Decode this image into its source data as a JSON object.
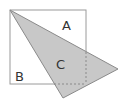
{
  "diagram": {
    "square": {
      "x": 10,
      "y": 10,
      "size": 74,
      "stroke": "#9a9a9a"
    },
    "triangle": {
      "points": "10,10 118,69 63,98",
      "fill": "#c8c8c8",
      "stroke": "#8a8a8a"
    },
    "labels": {
      "a": "A",
      "b": "B",
      "c": "C"
    }
  }
}
